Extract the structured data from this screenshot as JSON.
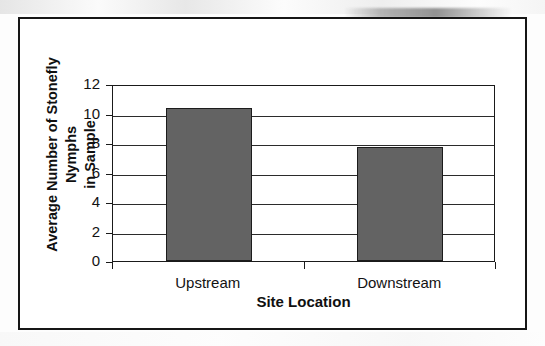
{
  "figure": {
    "border_color": "#161616",
    "background": "#ffffff"
  },
  "chart_data": {
    "type": "bar",
    "title": "",
    "categories": [
      "Upstream",
      "Downstream"
    ],
    "values": [
      10.4,
      7.7
    ],
    "series": [
      {
        "name": "Average Number of Stonefly Nymphs in Sample",
        "values": [
          10.4,
          7.7
        ]
      }
    ],
    "xlabel": "Site Location",
    "ylabel": "Average Number of Stonefly Nymphs in Sample",
    "ylabel_line1": "Average Number of Stonefly Nymphs",
    "ylabel_line2": "in Sample",
    "ylim": [
      0,
      12
    ],
    "ytick_values": [
      0,
      2,
      4,
      6,
      8,
      10,
      12
    ],
    "ytick_labels": [
      "0",
      "2",
      "4",
      "6",
      "8",
      "10",
      "12"
    ],
    "ytick_interval": 2,
    "grid": true,
    "grid_axis": "y",
    "legend": false,
    "legend_position": "none",
    "bar_fill_color": "#636363",
    "bar_border_color": "#1c1c1c",
    "gridline_color": "#2b2b2b",
    "axis_color": "#1a1a1a",
    "bar_width_fraction": 0.45
  }
}
